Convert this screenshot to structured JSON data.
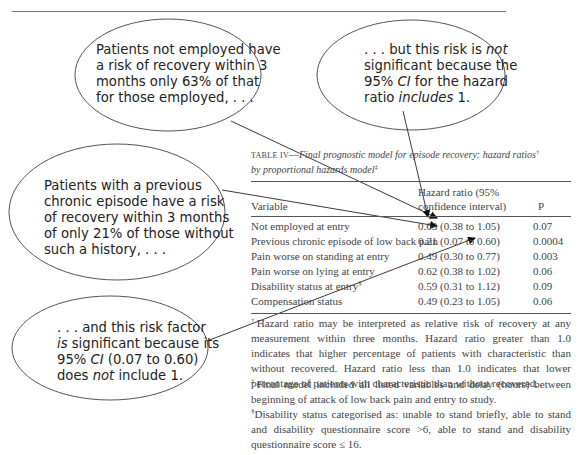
{
  "annotations": [
    {
      "id": "not-employed",
      "lines": [
        "Patients not employed have",
        "a risk of recovery within 3",
        "months only 63% of that",
        "for those employed, . . ."
      ]
    },
    {
      "id": "not-significant",
      "html_parts": [
        ". . . but this risk is ",
        "not",
        " significant because the 95% ",
        "CI",
        " for the hazard ratio ",
        "includes",
        " 1."
      ],
      "lines": [
        ". . . but this risk is not",
        "significant because the",
        "95% CI for the hazard",
        "ratio includes 1."
      ]
    },
    {
      "id": "previous-chronic",
      "lines": [
        "Patients with a previous",
        "chronic episode have a risk",
        "of recovery within 3 months",
        "of only 21% of those without",
        "such a history, . . ."
      ]
    },
    {
      "id": "significant",
      "lines": [
        ". . . and this risk factor",
        "is significant because its",
        "95% CI (0.07 to 0.60)",
        "does not include 1."
      ]
    }
  ],
  "table": {
    "label": "TABLE IV",
    "title": "Final prognostic model for episode recovery: hazard ratios",
    "title_sup": "†",
    "title_line2": "by proportional hazards model",
    "title_line2_sup": "‡",
    "columns": {
      "variable": "Variable",
      "hr_line1": "Hazard ratio (95%",
      "hr_line2": "confidence interval)",
      "p": "P"
    },
    "rows": [
      {
        "variable": "Not employed at entry",
        "hr": "0.63 (0.38 to 1.05)",
        "p": "0.07"
      },
      {
        "variable": "Previous chronic episode of low back pain",
        "hr": "0.21 (0.07 to 0.60)",
        "p": "0.0004"
      },
      {
        "variable": "Pain worse on standing at entry",
        "hr": "0.49 (0.30 to 0.77)",
        "p": "0.003"
      },
      {
        "variable": "Pain worse on lying at entry",
        "hr": "0.62 (0.38 to 1.02)",
        "p": "0.06"
      },
      {
        "variable": "Disability status at entry",
        "variable_sup": "§",
        "hr": "0.59 (0.31 to 1.12)",
        "p": "0.09"
      },
      {
        "variable": "Compensation status",
        "hr": "0.49 (0.23 to 1.05)",
        "p": "0.06"
      }
    ]
  },
  "footnotes": [
    {
      "mark": "†",
      "text": "Hazard ratio may be interpreted as relative risk of recovery at any measurement within three months. Hazard ratio greater than 1.0 indicates that higher percentage of patients with characteristic than without recovered. Hazard ratio less than 1.0 indicates that lower percentage of patients with characteristic than without recovered."
    },
    {
      "mark": "‡",
      "text": "Final model included all listed variables and delay (hours) between beginning of attack of low back pain and entry to study."
    },
    {
      "mark": "§",
      "text": "Disability status categorised as: unable to stand briefly, able to stand and disability questionnaire score >6, able to stand and disability questionnaire score ≤ 16."
    }
  ]
}
